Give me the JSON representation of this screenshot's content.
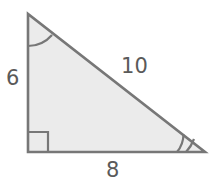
{
  "figure": {
    "kind": "right-triangle-diagram",
    "background_color": "#ffffff",
    "fill_color": "#ebebeb",
    "stroke_color": "#777777",
    "label_color": "#5a5a5a",
    "width": 211,
    "height": 194
  },
  "triangle": {
    "vertices": {
      "apex": {
        "x": 28,
        "y": 14
      },
      "right_angle": {
        "x": 28,
        "y": 152
      },
      "base_right": {
        "x": 205,
        "y": 152
      }
    },
    "path": "M28,14 L28,152 L205,152 Z"
  },
  "labels": {
    "leg_vertical": "6",
    "hypotenuse": "10",
    "leg_horizontal": "8"
  },
  "markers": {
    "apex_angle": {
      "name": "single-arc",
      "arc_count": 1,
      "path": "M28,46 A32,32 0 0,0 52,35"
    },
    "right_angle": {
      "name": "right-angle-square",
      "path": "M28,132 L48,132 L48,152"
    },
    "base_right_angle": {
      "name": "double-arc",
      "arc_count": 2,
      "paths": [
        "M177,152 A28,28 0 0,0 183,135",
        "M186,152 A37,37 0 0,0 193,140"
      ]
    }
  }
}
